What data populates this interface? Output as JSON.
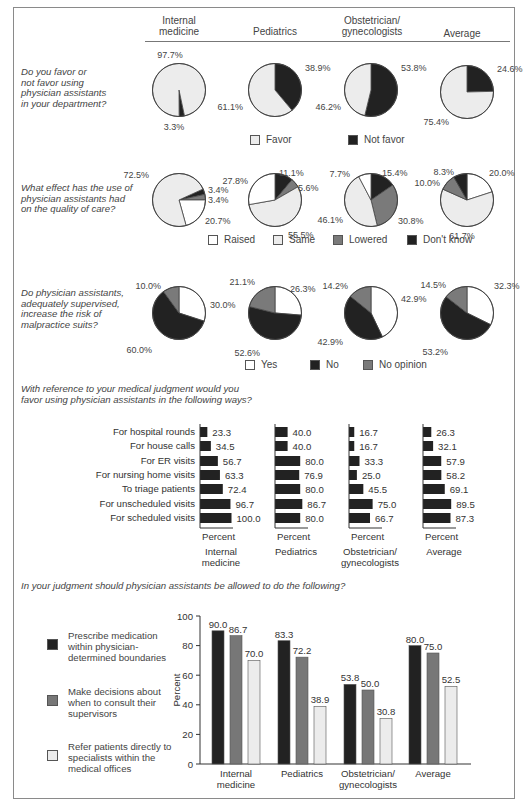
{
  "colors": {
    "favor": "#ececec",
    "not_favor": "#222222",
    "raised": "#ffffff",
    "same": "#ececec",
    "lowered": "#7a7a7a",
    "dont_know": "#222222",
    "yes": "#ffffff",
    "no": "#222222",
    "no_opinion": "#7a7a7a",
    "bar_dark": "#222222",
    "bar_mid": "#777777",
    "bar_light": "#ececec"
  },
  "header": {
    "columns": [
      {
        "line1": "Internal",
        "line2": "medicine"
      },
      {
        "line1": "",
        "line2": "Pediatrics"
      },
      {
        "line1": "Obstetrician/",
        "line2": "gynecologists"
      },
      {
        "line1": "",
        "line2": "Average"
      }
    ]
  },
  "questions": {
    "q1": {
      "lines": [
        "Do you favor or",
        "not favor using",
        "physician assistants",
        "in your department?"
      ]
    },
    "q2": {
      "lines": [
        "What effect has the use of",
        "physician assistants had",
        "on the quality of care?"
      ]
    },
    "q3": {
      "lines": [
        "Do physician assistants,",
        "adequately supervised,",
        "increase the risk of",
        "malpractice suits?"
      ]
    },
    "q4": {
      "lines": [
        "With reference to your medical judgment would you",
        "favor using physician assistants in the following ways?"
      ]
    },
    "q5": {
      "lines": [
        "In your judgment should physician assistants be allowed to do the following?"
      ]
    }
  },
  "legends": {
    "q1": [
      "Favor",
      "Not favor"
    ],
    "q2": [
      "Raised",
      "Same",
      "Lowered",
      "Don't know"
    ],
    "q3": [
      "Yes",
      "No",
      "No opinion"
    ],
    "q5": [
      [
        "Prescribe medication",
        "within physician-",
        "determined boundaries"
      ],
      [
        "Make decisions about",
        "when to consult their",
        "supervisors"
      ],
      [
        "Refer patients directly to",
        "specialists within the",
        "medical offices"
      ]
    ]
  },
  "chart_data": [
    {
      "type": "pie",
      "title": "Do you favor or not favor using physician assistants in your department?",
      "legend": [
        "Favor",
        "Not favor"
      ],
      "pies": [
        {
          "name": "Internal medicine",
          "values": {
            "Favor": 97.7,
            "Not favor": 3.3
          }
        },
        {
          "name": "Pediatrics",
          "values": {
            "Favor": 61.1,
            "Not favor": 38.9
          }
        },
        {
          "name": "Obstetrician/gynecologists",
          "values": {
            "Favor": 46.2,
            "Not favor": 53.8
          }
        },
        {
          "name": "Average",
          "values": {
            "Favor": 75.4,
            "Not favor": 24.6
          }
        }
      ]
    },
    {
      "type": "pie",
      "title": "What effect has the use of physician assistants had on the quality of care?",
      "legend": [
        "Raised",
        "Same",
        "Lowered",
        "Don't know"
      ],
      "pies": [
        {
          "name": "Internal medicine",
          "values": {
            "Raised": 20.7,
            "Same": 72.5,
            "Lowered": 3.4,
            "Don't know": 3.4
          }
        },
        {
          "name": "Pediatrics",
          "values": {
            "Raised": 27.8,
            "Same": 55.5,
            "Lowered": 5.6,
            "Don't know": 11.1
          }
        },
        {
          "name": "Obstetrician/gynecologists",
          "values": {
            "Raised": 7.7,
            "Same": 46.1,
            "Lowered": 30.8,
            "Don't know": 15.4
          }
        },
        {
          "name": "Average",
          "values": {
            "Raised": 20.0,
            "Same": 61.7,
            "Lowered": 10.0,
            "Don't know": 8.3
          }
        }
      ]
    },
    {
      "type": "pie",
      "title": "Do physician assistants, adequately supervised, increase the risk of malpractice suits?",
      "legend": [
        "Yes",
        "No",
        "No opinion"
      ],
      "pies": [
        {
          "name": "Internal medicine",
          "values": {
            "Yes": 30.0,
            "No": 60.0,
            "No opinion": 10.0
          }
        },
        {
          "name": "Pediatrics",
          "values": {
            "Yes": 26.3,
            "No": 52.6,
            "No opinion": 21.1
          }
        },
        {
          "name": "Obstetrician/gynecologists",
          "values": {
            "Yes": 42.9,
            "No": 42.9,
            "No opinion": 14.2
          }
        },
        {
          "name": "Average",
          "values": {
            "Yes": 32.3,
            "No": 53.2,
            "No opinion": 14.5
          }
        }
      ]
    },
    {
      "type": "bar",
      "orientation": "horizontal",
      "title": "With reference to your medical judgment would you favor using physician assistants in the following ways?",
      "xlabel": "Percent",
      "categories": [
        "For hospital rounds",
        "For house calls",
        "For ER visits",
        "For nursing home visits",
        "To triage patients",
        "For unscheduled visits",
        "For scheduled visits"
      ],
      "series": [
        {
          "name": "Internal medicine",
          "values": [
            23.3,
            34.5,
            56.7,
            63.3,
            72.4,
            96.7,
            100.0
          ]
        },
        {
          "name": "Pediatrics",
          "values": [
            40.0,
            40.0,
            80.0,
            76.9,
            80.0,
            86.7,
            80.0
          ]
        },
        {
          "name": "Obstetrician/gynecologists",
          "values": [
            16.7,
            16.7,
            33.3,
            25.0,
            45.5,
            75.0,
            66.7
          ]
        },
        {
          "name": "Average",
          "values": [
            26.3,
            32.1,
            57.9,
            58.2,
            69.1,
            89.5,
            87.3
          ]
        }
      ]
    },
    {
      "type": "bar",
      "orientation": "vertical",
      "title": "In your judgment should physician assistants be allowed to do the following?",
      "ylabel": "Percent",
      "ylim": [
        0,
        100
      ],
      "yticks": [
        0,
        20,
        40,
        60,
        80,
        100
      ],
      "categories": [
        "Internal medicine",
        "Pediatrics",
        "Obstetrician/gynecologists",
        "Average"
      ],
      "series": [
        {
          "name": "Prescribe medication within physician-determined boundaries",
          "values": [
            90.0,
            83.3,
            53.8,
            80.0
          ]
        },
        {
          "name": "Make decisions about when to consult their supervisors",
          "values": [
            86.7,
            72.2,
            50.0,
            75.0
          ]
        },
        {
          "name": "Refer patients directly to specialists within the medical offices",
          "values": [
            70.0,
            38.9,
            30.8,
            52.5
          ]
        }
      ]
    }
  ],
  "hbar_axis_label": "Percent",
  "hbar_column_labels": [
    [
      "Internal",
      "medicine"
    ],
    [
      "Pediatrics",
      ""
    ],
    [
      "Obstetrician/",
      "gynecologists"
    ],
    [
      "Average",
      ""
    ]
  ],
  "vbar_category_labels": [
    [
      "Internal",
      "medicine"
    ],
    [
      "Pediatrics",
      ""
    ],
    [
      "Obstetrician/",
      "gynecologists"
    ],
    [
      "Average",
      ""
    ]
  ]
}
